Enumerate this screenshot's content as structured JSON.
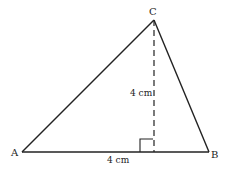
{
  "diagram": {
    "type": "triangle",
    "vertices": {
      "A": {
        "label": "A",
        "x": 22,
        "y": 152
      },
      "B": {
        "label": "B",
        "x": 209,
        "y": 152
      },
      "C": {
        "label": "C",
        "x": 154,
        "y": 20
      }
    },
    "height_foot": {
      "x": 154,
      "y": 152
    },
    "labels": {
      "height": "4 cm",
      "base": "4 cm"
    },
    "colors": {
      "stroke": "#222222",
      "background": "#ffffff"
    }
  }
}
